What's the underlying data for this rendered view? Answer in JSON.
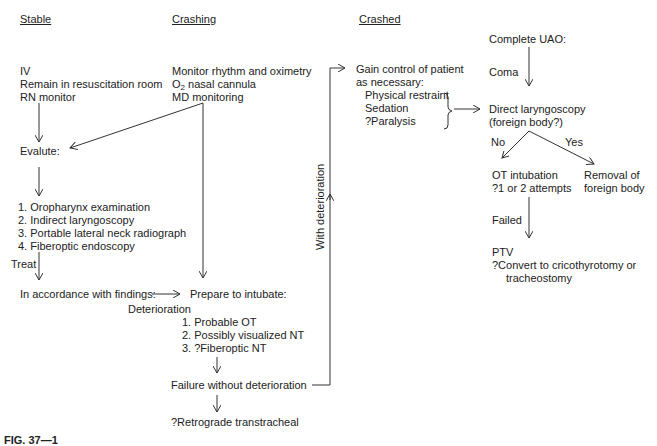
{
  "headers": {
    "stable": "Stable",
    "crashing": "Crashing",
    "crashed": "Crashed"
  },
  "stable": {
    "lines": [
      "IV",
      "Remain in resuscitation room",
      "RN monitor"
    ],
    "evaluate": "Evalute:",
    "steps": [
      "1.  Oropharynx examination",
      "2.   Indirect laryngoscopy",
      "3.  Portable lateral neck radiograph",
      "4.  Fiberoptic endoscopy"
    ],
    "treat": "Treat",
    "findings": "In accordance with findings:"
  },
  "crashing": {
    "line1": "Monitor rhythm and oximetry",
    "line2_pre": "O",
    "line2_sub": "2",
    "line2_post": " nasal cannula",
    "line3": "MD monitoring",
    "prepare": "Prepare to intubate:",
    "deterioration": "Deterioration",
    "options": [
      "1.  Probable OT",
      "2.  Possibly visualized NT",
      "3.  ?Fiberoptic NT"
    ],
    "failure": "Failure without deterioration",
    "retrograde": "?Retrograde transtracheal"
  },
  "crashed": {
    "with_deterioration": "With deterioration",
    "gain1": "Gain control of patient",
    "gain2": "as necessary:",
    "measures": [
      "Physical restraint",
      "Sedation",
      "?Paralysis"
    ],
    "complete_uao": "Complete UAO:",
    "coma": "Coma",
    "direct1": "Direct laryngoscopy",
    "direct2": "(foreign body?)",
    "no": "No",
    "yes": "Yes",
    "ot1": "OT intubation",
    "ot2": "?1 or 2 attempts",
    "removal1": "Removal of",
    "removal2": "foreign body",
    "failed": "Failed",
    "ptv": "PTV",
    "convert1": "?Convert to cricothyrotomy or",
    "convert2": "tracheostomy"
  },
  "caption": "FIG. 37—1"
}
